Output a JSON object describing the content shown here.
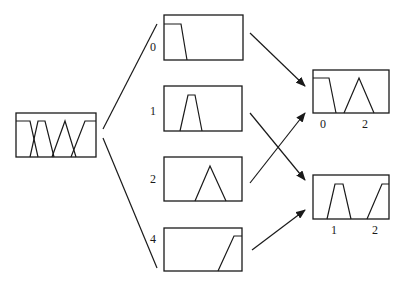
{
  "diagram": {
    "title": "",
    "stroke_color": "#1a1a1a",
    "background": "#ffffff",
    "input_box": {
      "id": "input",
      "rect": [
        16,
        113,
        80,
        44
      ],
      "mfs": [
        [
          [
            16,
            121
          ],
          [
            30,
            121
          ],
          [
            38,
            157
          ]
        ],
        [
          [
            30,
            157
          ],
          [
            38,
            121
          ],
          [
            45,
            121
          ],
          [
            54,
            157
          ]
        ],
        [
          [
            52,
            157
          ],
          [
            65,
            121
          ],
          [
            76,
            157
          ]
        ],
        [
          [
            71,
            157
          ],
          [
            85,
            121
          ],
          [
            96,
            121
          ]
        ]
      ]
    },
    "middle_boxes": [
      {
        "id": "box-0",
        "label": "0",
        "label_pos": [
          150,
          51
        ],
        "rect": [
          164,
          15,
          79,
          45
        ],
        "mfs": [
          [
            [
              164,
              24
            ],
            [
              181,
              24
            ],
            [
              187,
              60
            ]
          ]
        ]
      },
      {
        "id": "box-1",
        "label": "1",
        "label_pos": [
          150,
          115
        ],
        "rect": [
          164,
          86,
          78,
          45
        ],
        "mfs": [
          [
            [
              180,
              131
            ],
            [
              188,
              95
            ],
            [
              195,
              95
            ],
            [
              202,
              131
            ]
          ]
        ]
      },
      {
        "id": "box-2",
        "label": "2",
        "label_pos": [
          150,
          183
        ],
        "rect": [
          164,
          157,
          78,
          44
        ],
        "mfs": [
          [
            [
              195,
              201
            ],
            [
              210,
              166
            ],
            [
              226,
              201
            ]
          ]
        ]
      },
      {
        "id": "box-4",
        "label": "4",
        "label_pos": [
          150,
          243
        ],
        "rect": [
          164,
          228,
          78,
          43
        ],
        "mfs": [
          [
            [
              218,
              271
            ],
            [
              234,
              236
            ],
            [
              242,
              236
            ]
          ]
        ]
      }
    ],
    "output_boxes": [
      {
        "id": "out-top",
        "rect": [
          313,
          70,
          76,
          43
        ],
        "mfs": [
          [
            [
              313,
              78
            ],
            [
              329,
              78
            ],
            [
              336,
              113
            ]
          ],
          [
            [
              344,
              113
            ],
            [
              359,
              78
            ],
            [
              374,
              113
            ]
          ]
        ],
        "labels": [
          {
            "text": "0",
            "pos": [
              320,
              128
            ]
          },
          {
            "text": "2",
            "pos": [
              362,
              128
            ]
          }
        ]
      },
      {
        "id": "out-bottom",
        "rect": [
          313,
          175,
          76,
          44
        ],
        "mfs": [
          [
            [
              327,
              219
            ],
            [
              335,
              184
            ],
            [
              343,
              184
            ],
            [
              351,
              219
            ]
          ],
          [
            [
              367,
              219
            ],
            [
              382,
              184
            ],
            [
              389,
              184
            ]
          ]
        ],
        "labels": [
          {
            "text": "1",
            "pos": [
              331,
              234
            ]
          },
          {
            "text": "2",
            "pos": [
              372,
              234
            ]
          }
        ]
      }
    ],
    "fan_lines": [
      {
        "from": [
          103,
          129
        ],
        "to": [
          157,
          24
        ]
      },
      {
        "from": [
          103,
          138
        ],
        "to": [
          157,
          268
        ]
      }
    ],
    "arrows": [
      {
        "from": "box-0",
        "to": "out-top",
        "start": [
          250,
          33
        ],
        "end": [
          305,
          86
        ]
      },
      {
        "from": "box-1",
        "to": "out-bottom",
        "start": [
          250,
          113
        ],
        "end": [
          305,
          180
        ]
      },
      {
        "from": "box-2",
        "to": "out-top",
        "start": [
          250,
          183
        ],
        "end": [
          305,
          113
        ]
      },
      {
        "from": "box-4",
        "to": "out-bottom",
        "start": [
          252,
          250
        ],
        "end": [
          305,
          210
        ]
      }
    ]
  }
}
